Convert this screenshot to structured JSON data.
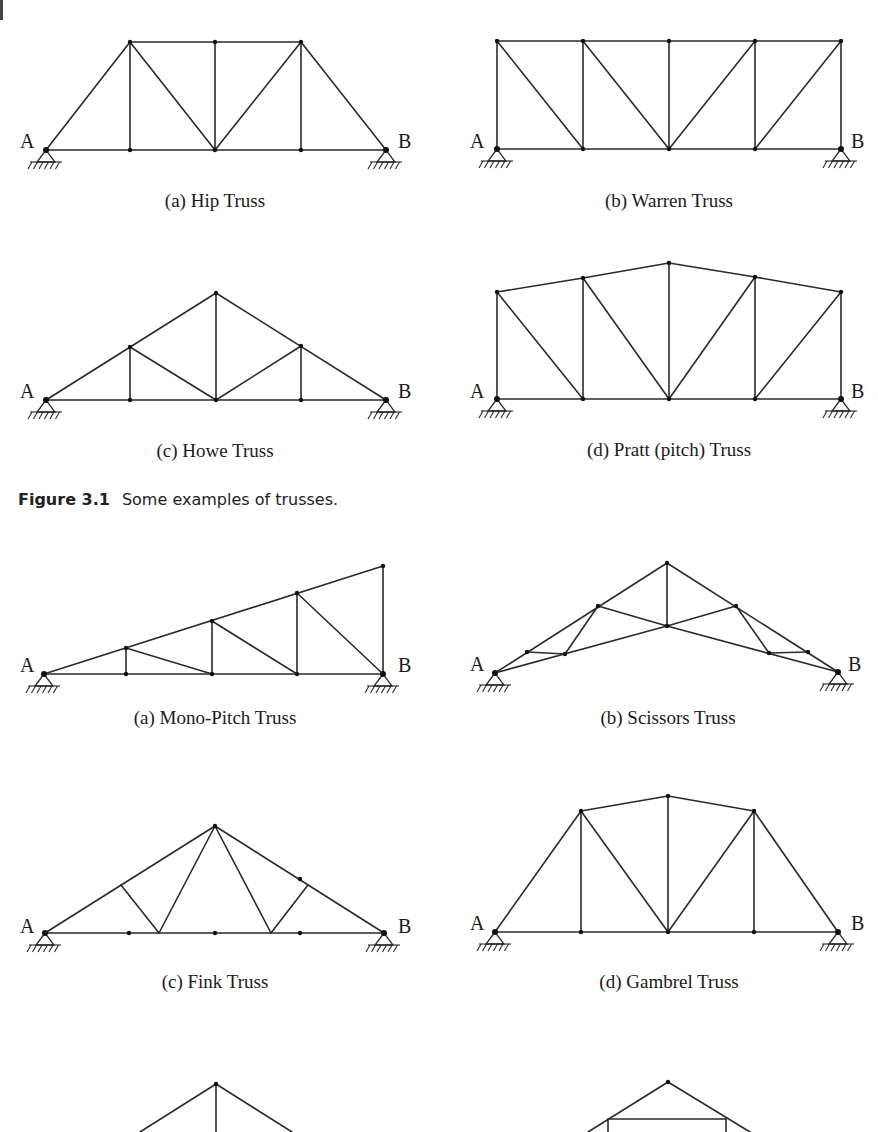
{
  "figure_caption": {
    "number": "Figure 3.1",
    "text": "Some examples of trusses."
  },
  "colors": {
    "line": "#2a2a2a",
    "text": "#1a1a1a",
    "background": "#ffffff"
  },
  "trusses": [
    {
      "id": "hip",
      "caption": "(a) Hip Truss",
      "caption_pos": [
        215,
        207
      ],
      "labels": [
        {
          "t": "A",
          "x": 20,
          "y": 148
        },
        {
          "t": "B",
          "x": 398,
          "y": 148
        }
      ],
      "supports": [
        [
          46,
          150
        ],
        [
          386,
          150
        ]
      ],
      "nodes": [
        [
          46,
          150
        ],
        [
          130,
          150
        ],
        [
          215,
          150
        ],
        [
          301,
          150
        ],
        [
          386,
          150
        ],
        [
          130,
          42
        ],
        [
          215,
          42
        ],
        [
          301,
          42
        ]
      ],
      "members": [
        [
          46,
          150,
          386,
          150
        ],
        [
          130,
          42,
          301,
          42
        ],
        [
          46,
          150,
          130,
          42
        ],
        [
          301,
          42,
          386,
          150
        ],
        [
          130,
          42,
          130,
          150
        ],
        [
          130,
          42,
          215,
          150
        ],
        [
          215,
          42,
          215,
          150
        ],
        [
          301,
          42,
          215,
          150
        ],
        [
          301,
          42,
          301,
          150
        ]
      ]
    },
    {
      "id": "warren",
      "caption": "(b) Warren Truss",
      "caption_pos": [
        669,
        207
      ],
      "labels": [
        {
          "t": "A",
          "x": 470,
          "y": 148
        },
        {
          "t": "B",
          "x": 851,
          "y": 148
        }
      ],
      "supports": [
        [
          497,
          149
        ],
        [
          841,
          149
        ]
      ],
      "nodes": [
        [
          497,
          149
        ],
        [
          583,
          149
        ],
        [
          669,
          149
        ],
        [
          755,
          149
        ],
        [
          841,
          149
        ],
        [
          497,
          41
        ],
        [
          583,
          41
        ],
        [
          669,
          41
        ],
        [
          755,
          41
        ],
        [
          841,
          41
        ]
      ],
      "members": [
        [
          497,
          149,
          841,
          149
        ],
        [
          497,
          41,
          841,
          41
        ],
        [
          497,
          41,
          497,
          149
        ],
        [
          583,
          41,
          583,
          149
        ],
        [
          669,
          41,
          669,
          149
        ],
        [
          755,
          41,
          755,
          149
        ],
        [
          841,
          41,
          841,
          149
        ],
        [
          497,
          41,
          583,
          149
        ],
        [
          583,
          41,
          669,
          149
        ],
        [
          755,
          41,
          669,
          149
        ],
        [
          841,
          41,
          755,
          149
        ]
      ]
    },
    {
      "id": "howe",
      "caption": "(c) Howe Truss",
      "caption_pos": [
        215,
        457
      ],
      "labels": [
        {
          "t": "A",
          "x": 20,
          "y": 398
        },
        {
          "t": "B",
          "x": 398,
          "y": 398
        }
      ],
      "supports": [
        [
          46,
          400
        ],
        [
          386,
          400
        ]
      ],
      "nodes": [
        [
          46,
          400
        ],
        [
          130,
          400
        ],
        [
          216,
          400
        ],
        [
          301,
          400
        ],
        [
          386,
          400
        ],
        [
          130,
          347
        ],
        [
          216,
          293
        ],
        [
          301,
          346
        ]
      ],
      "members": [
        [
          46,
          400,
          386,
          400
        ],
        [
          46,
          400,
          216,
          293
        ],
        [
          216,
          293,
          386,
          400
        ],
        [
          130,
          347,
          130,
          400
        ],
        [
          216,
          293,
          216,
          400
        ],
        [
          301,
          346,
          301,
          400
        ],
        [
          130,
          347,
          216,
          400
        ],
        [
          301,
          346,
          216,
          400
        ]
      ]
    },
    {
      "id": "pratt",
      "caption": "(d) Pratt (pitch) Truss",
      "caption_pos": [
        669,
        456
      ],
      "labels": [
        {
          "t": "A",
          "x": 470,
          "y": 398
        },
        {
          "t": "B",
          "x": 851,
          "y": 398
        }
      ],
      "supports": [
        [
          497,
          399
        ],
        [
          841,
          399
        ]
      ],
      "nodes": [
        [
          497,
          399
        ],
        [
          583,
          399
        ],
        [
          669,
          399
        ],
        [
          755,
          399
        ],
        [
          841,
          399
        ],
        [
          497,
          292
        ],
        [
          583,
          278
        ],
        [
          669,
          263
        ],
        [
          755,
          277
        ],
        [
          841,
          292
        ]
      ],
      "members": [
        [
          497,
          399,
          841,
          399
        ],
        [
          497,
          292,
          583,
          278
        ],
        [
          583,
          278,
          669,
          263
        ],
        [
          669,
          263,
          755,
          277
        ],
        [
          755,
          277,
          841,
          292
        ],
        [
          497,
          292,
          497,
          399
        ],
        [
          583,
          278,
          583,
          399
        ],
        [
          669,
          263,
          669,
          399
        ],
        [
          755,
          277,
          755,
          399
        ],
        [
          841,
          292,
          841,
          399
        ],
        [
          497,
          292,
          583,
          399
        ],
        [
          583,
          278,
          669,
          399
        ],
        [
          755,
          277,
          669,
          399
        ],
        [
          841,
          292,
          755,
          399
        ]
      ]
    },
    {
      "id": "mono-pitch",
      "caption": "(a) Mono-Pitch Truss",
      "caption_pos": [
        215,
        724
      ],
      "labels": [
        {
          "t": "A",
          "x": 20,
          "y": 672
        },
        {
          "t": "B",
          "x": 398,
          "y": 672
        }
      ],
      "supports": [
        [
          44,
          674
        ],
        [
          383,
          674
        ]
      ],
      "nodes": [
        [
          44,
          674
        ],
        [
          126,
          674
        ],
        [
          212,
          674
        ],
        [
          297,
          674
        ],
        [
          383,
          674
        ],
        [
          126,
          648
        ],
        [
          212,
          621
        ],
        [
          297,
          593
        ],
        [
          383,
          566
        ]
      ],
      "members": [
        [
          44,
          674,
          383,
          674
        ],
        [
          44,
          674,
          383,
          566
        ],
        [
          383,
          566,
          383,
          674
        ],
        [
          126,
          648,
          126,
          674
        ],
        [
          212,
          621,
          212,
          674
        ],
        [
          297,
          593,
          297,
          674
        ],
        [
          126,
          648,
          212,
          674
        ],
        [
          212,
          621,
          297,
          674
        ],
        [
          297,
          593,
          383,
          674
        ]
      ]
    },
    {
      "id": "scissors",
      "caption": "(b) Scissors Truss",
      "caption_pos": [
        668,
        724
      ],
      "labels": [
        {
          "t": "A",
          "x": 470,
          "y": 671
        },
        {
          "t": "B",
          "x": 848,
          "y": 671
        }
      ],
      "supports": [
        [
          495,
          673
        ],
        [
          838,
          672
        ]
      ],
      "nodes": [
        [
          495,
          673
        ],
        [
          838,
          672
        ],
        [
          667,
          563
        ],
        [
          598,
          606
        ],
        [
          736,
          606
        ],
        [
          667,
          626
        ],
        [
          527,
          652
        ],
        [
          565,
          654
        ],
        [
          769,
          653
        ],
        [
          808,
          652
        ]
      ],
      "members": [
        [
          495,
          673,
          667,
          563
        ],
        [
          667,
          563,
          838,
          672
        ],
        [
          667,
          563,
          667,
          626
        ],
        [
          495,
          673,
          667,
          626
        ],
        [
          667,
          626,
          838,
          672
        ],
        [
          598,
          606,
          667,
          626
        ],
        [
          736,
          606,
          667,
          626
        ],
        [
          598,
          606,
          565,
          654
        ],
        [
          736,
          606,
          769,
          653
        ],
        [
          527,
          652,
          565,
          654
        ],
        [
          769,
          653,
          808,
          652
        ]
      ]
    },
    {
      "id": "fink",
      "caption": "(c) Fink Truss",
      "caption_pos": [
        215,
        988
      ],
      "labels": [
        {
          "t": "A",
          "x": 20,
          "y": 933
        },
        {
          "t": "B",
          "x": 398,
          "y": 933
        }
      ],
      "supports": [
        [
          45,
          933
        ],
        [
          384,
          933
        ]
      ],
      "nodes": [
        [
          45,
          933
        ],
        [
          129,
          933
        ],
        [
          215,
          933
        ],
        [
          300,
          933
        ],
        [
          384,
          933
        ],
        [
          215,
          826
        ],
        [
          300,
          879
        ]
      ],
      "members": [
        [
          45,
          933,
          384,
          933
        ],
        [
          45,
          933,
          215,
          826
        ],
        [
          215,
          826,
          384,
          933
        ],
        [
          215,
          826,
          159,
          933
        ],
        [
          215,
          826,
          271,
          933
        ],
        [
          121,
          885,
          159,
          933
        ],
        [
          308,
          885,
          271,
          933
        ]
      ]
    },
    {
      "id": "gambrel",
      "caption": "(d) Gambrel Truss",
      "caption_pos": [
        669,
        988
      ],
      "labels": [
        {
          "t": "A",
          "x": 470,
          "y": 930
        },
        {
          "t": "B",
          "x": 851,
          "y": 930
        }
      ],
      "supports": [
        [
          495,
          932
        ],
        [
          838,
          932
        ]
      ],
      "nodes": [
        [
          495,
          932
        ],
        [
          581,
          932
        ],
        [
          668,
          932
        ],
        [
          754,
          932
        ],
        [
          838,
          932
        ],
        [
          581,
          811
        ],
        [
          668,
          796
        ],
        [
          754,
          811
        ]
      ],
      "members": [
        [
          495,
          932,
          838,
          932
        ],
        [
          495,
          932,
          581,
          811
        ],
        [
          581,
          811,
          668,
          796
        ],
        [
          668,
          796,
          754,
          811
        ],
        [
          754,
          811,
          838,
          932
        ],
        [
          581,
          811,
          581,
          932
        ],
        [
          668,
          796,
          668,
          932
        ],
        [
          754,
          811,
          754,
          932
        ],
        [
          581,
          811,
          668,
          932
        ],
        [
          754,
          811,
          668,
          932
        ]
      ]
    },
    {
      "id": "partial-king-post",
      "caption": "",
      "caption_pos": [
        215,
        1200
      ],
      "labels": [],
      "supports": [],
      "nodes": [
        [
          216,
          1084
        ]
      ],
      "members": [
        [
          216,
          1084,
          140,
          1132
        ],
        [
          216,
          1084,
          292,
          1132
        ],
        [
          216,
          1084,
          216,
          1132
        ]
      ]
    },
    {
      "id": "partial-queen-post",
      "caption": "",
      "caption_pos": [
        668,
        1200
      ],
      "labels": [],
      "supports": [],
      "nodes": [
        [
          668,
          1082
        ]
      ],
      "members": [
        [
          668,
          1082,
          588,
          1132
        ],
        [
          668,
          1082,
          750,
          1132
        ],
        [
          608,
          1119,
          726,
          1119
        ],
        [
          608,
          1119,
          608,
          1132
        ],
        [
          726,
          1119,
          726,
          1132
        ]
      ]
    }
  ]
}
